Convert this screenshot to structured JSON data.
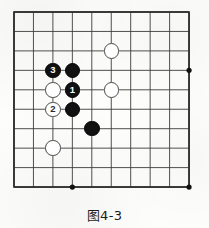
{
  "figure": {
    "caption": "图4-3",
    "kind": "go-board-diagram"
  },
  "board": {
    "columns": 10,
    "rows": 10,
    "origin_x": 14,
    "origin_y": 12,
    "spacing": 19.45,
    "line_color": "#3c3c3c",
    "border_color": "#2e2e2e",
    "background_color": "#fdfdfc",
    "star_point_color": "#111111",
    "star_points": [
      {
        "name": "star-point-right",
        "col": 9,
        "row": 3
      },
      {
        "name": "star-point-bottom-left",
        "col": 3,
        "row": 9
      },
      {
        "name": "star-point-bottom-right",
        "col": 9,
        "row": 9
      }
    ]
  },
  "stones": [
    {
      "id": "white-stone-upper-right",
      "color": "white",
      "label": "",
      "col": 5,
      "row": 2
    },
    {
      "id": "black-stone-move-3",
      "color": "black",
      "label": "3",
      "col": 2,
      "row": 3
    },
    {
      "id": "black-stone-top",
      "color": "black",
      "label": "",
      "col": 3,
      "row": 3
    },
    {
      "id": "white-stone-left",
      "color": "white",
      "label": "",
      "col": 2,
      "row": 4
    },
    {
      "id": "black-stone-move-1",
      "color": "black",
      "label": "1",
      "col": 3,
      "row": 4
    },
    {
      "id": "white-stone-right",
      "color": "white",
      "label": "",
      "col": 5,
      "row": 4
    },
    {
      "id": "white-stone-move-2",
      "color": "white",
      "label": "2",
      "col": 2,
      "row": 5
    },
    {
      "id": "black-stone-lower",
      "color": "black",
      "label": "",
      "col": 3,
      "row": 5
    },
    {
      "id": "black-stone-diagonal",
      "color": "black",
      "label": "",
      "col": 4,
      "row": 6
    },
    {
      "id": "white-stone-bottom-left",
      "color": "white",
      "label": "",
      "col": 2,
      "row": 7
    }
  ],
  "stone_style": {
    "diameter": 15.5,
    "black_fill": "#111111",
    "white_fill": "#ffffff",
    "white_edge": "#4a4a4a",
    "black_label_color": "#ffffff",
    "white_label_color": "#2a2a2a"
  }
}
